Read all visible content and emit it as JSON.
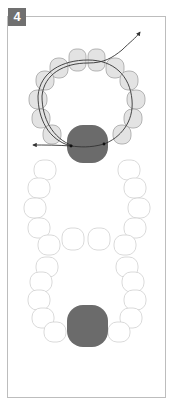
{
  "step": {
    "number": "4"
  },
  "diagram": {
    "colors": {
      "frame": "#bdbdbd",
      "badge_bg": "#707070",
      "badge_text": "#ffffff",
      "active_bead_fill": "#e3e3e3",
      "active_bead_stroke": "#9a9a9a",
      "inactive_bead_fill": "#ffffff",
      "inactive_bead_stroke": "#d0d0d0",
      "large_bead_fill": "#6b6b6b",
      "thread": "#333333"
    },
    "rings": [
      {
        "name": "upper-ring",
        "state": "active",
        "bead_count": 14
      },
      {
        "name": "lower-ring",
        "state": "inactive",
        "bead_count": 14
      }
    ],
    "large_beads": 2,
    "thread_arrows": [
      "top-right-exit",
      "left-exit"
    ]
  }
}
